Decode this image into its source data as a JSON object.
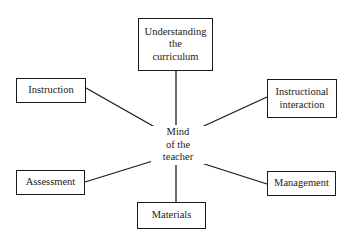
{
  "diagram": {
    "center": {
      "lines": [
        "Mind",
        "of the",
        "teacher"
      ]
    },
    "nodes": [
      {
        "id": "understanding",
        "lines": [
          "Understanding",
          "the",
          "curriculum"
        ]
      },
      {
        "id": "instruction",
        "lines": [
          "Instruction"
        ]
      },
      {
        "id": "instructional-interaction",
        "lines": [
          "Instructional",
          "interaction"
        ]
      },
      {
        "id": "assessment",
        "lines": [
          "Assessment"
        ]
      },
      {
        "id": "management",
        "lines": [
          "Management"
        ]
      },
      {
        "id": "materials",
        "lines": [
          "Materials"
        ]
      }
    ],
    "edges": [
      {
        "from": "center",
        "to": "understanding"
      },
      {
        "from": "center",
        "to": "instruction"
      },
      {
        "from": "center",
        "to": "instructional-interaction"
      },
      {
        "from": "center",
        "to": "assessment"
      },
      {
        "from": "center",
        "to": "management"
      },
      {
        "from": "center",
        "to": "materials"
      }
    ],
    "colors": {
      "stroke": "#1a1a1a",
      "background": "#ffffff"
    }
  }
}
